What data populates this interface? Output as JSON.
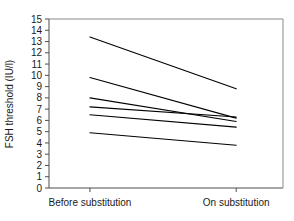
{
  "chart_data": {
    "type": "line",
    "title": "",
    "subtitle": "",
    "xlabel": "",
    "ylabel": "FSH threshold (IU/l)",
    "categories": [
      "Before substitution",
      "On substitution"
    ],
    "x": [
      0,
      1
    ],
    "ylim": [
      0,
      15
    ],
    "xlim": [
      -0.28,
      1.32
    ],
    "ytick_labels": [
      "0",
      "1",
      "2",
      "3",
      "4",
      "5",
      "6",
      "7",
      "8",
      "9",
      "10",
      "11",
      "12",
      "13",
      "14",
      "15"
    ],
    "ytick_values": [
      0,
      1,
      2,
      3,
      4,
      5,
      6,
      7,
      8,
      9,
      10,
      11,
      12,
      13,
      14,
      15
    ],
    "grid": false,
    "legend": false,
    "legend_position": "none",
    "annotations": [],
    "series": [
      {
        "name": "subject-1",
        "values": [
          13.4,
          8.8
        ]
      },
      {
        "name": "subject-2",
        "values": [
          9.8,
          6.2
        ]
      },
      {
        "name": "subject-3",
        "values": [
          8.0,
          5.9
        ]
      },
      {
        "name": "subject-4",
        "values": [
          7.2,
          6.3
        ]
      },
      {
        "name": "subject-5",
        "values": [
          6.5,
          5.4
        ]
      },
      {
        "name": "subject-6",
        "values": [
          4.9,
          3.8
        ]
      }
    ],
    "colors": {
      "line": "#000000",
      "frame": "#8a8a8a",
      "axis": "#4d4d4d",
      "text": "#1a1a1a",
      "background": "#ffffff"
    }
  }
}
